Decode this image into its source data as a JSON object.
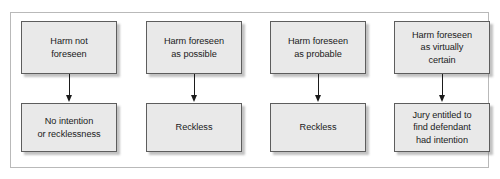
{
  "diagram": {
    "frame": {
      "border_color": "#b9b9b9"
    },
    "style": {
      "box_fill": "#e9e9e9",
      "box_border": "#5d5d5d",
      "text_color": "#1b1b1b",
      "arrow_color": "#1b1b1b",
      "background": "#ffffff"
    },
    "columns": [
      {
        "id": "column-1",
        "top_node": {
          "id": "node-harm-not-foreseen",
          "label": "Harm not\nforeseen"
        },
        "connector": {
          "id": "arrow-1",
          "type": "arrow-down"
        },
        "bottom_node": {
          "id": "node-no-intention-or-recklessness",
          "label": "No intention\nor recklessness"
        }
      },
      {
        "id": "column-2",
        "top_node": {
          "id": "node-harm-foreseen-as-possible",
          "label": "Harm foreseen\nas possible"
        },
        "connector": {
          "id": "arrow-2",
          "type": "arrow-down"
        },
        "bottom_node": {
          "id": "node-reckless-possible",
          "label": "Reckless"
        }
      },
      {
        "id": "column-3",
        "top_node": {
          "id": "node-harm-foreseen-as-probable",
          "label": "Harm foreseen\nas probable"
        },
        "connector": {
          "id": "arrow-3",
          "type": "arrow-down"
        },
        "bottom_node": {
          "id": "node-reckless-probable",
          "label": "Reckless"
        }
      },
      {
        "id": "column-4",
        "top_node": {
          "id": "node-harm-foreseen-as-virtually-certain",
          "label": "Harm foreseen\nas virtually\ncertain"
        },
        "connector": {
          "id": "arrow-4",
          "type": "arrow-down"
        },
        "bottom_node": {
          "id": "node-jury-entitled-to-find-intention",
          "label": "Jury entitled to\nfind defendant\nhad intention"
        }
      }
    ]
  }
}
